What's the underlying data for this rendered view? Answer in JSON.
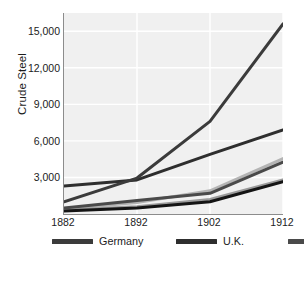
{
  "chart_data": {
    "type": "line",
    "title": "",
    "xlabel": "",
    "ylabel": "Crude Steel",
    "x": [
      1882,
      1892,
      1902,
      1912
    ],
    "xtick_labels": [
      "1882",
      "1892",
      "1902",
      "1912"
    ],
    "ytick_labels": [
      "3,000",
      "6,000",
      "9,000",
      "12,000",
      "15,000"
    ],
    "ytick_values": [
      3000,
      6000,
      9000,
      12000,
      15000
    ],
    "ylim": [
      0,
      16500
    ],
    "xlim": [
      1882,
      1912
    ],
    "grid": true,
    "legend_position": "below-axes",
    "plot_background": "#f0f0f0",
    "gridline_color": "#ffffff",
    "axis_color": "#8c8c8c",
    "series": [
      {
        "name": "Germany",
        "color": "#3b3b3b",
        "values": [
          1000,
          2950,
          7600,
          15600
        ]
      },
      {
        "name": "U.K.",
        "color": "#2e2e2e",
        "values": [
          2300,
          2800,
          4900,
          6900
        ]
      },
      {
        "name": "France",
        "color": "#4a4a4a",
        "values": [
          500,
          1100,
          1700,
          4250
        ]
      },
      {
        "name": "Austria",
        "color": "#b4b4b4",
        "values": [
          400,
          950,
          1900,
          4550
        ]
      },
      {
        "name": "Russia",
        "color": "#9a9a9a",
        "values": [
          300,
          600,
          1200,
          2800
        ]
      },
      {
        "name": "Belgium",
        "color": "#141414",
        "values": [
          250,
          500,
          1000,
          2650
        ]
      }
    ]
  },
  "legend": {
    "items": [
      {
        "label": "Germany",
        "color": "#3b3b3b"
      },
      {
        "label": "U.K.",
        "color": "#2e2e2e"
      },
      {
        "label": "France",
        "color": "#4a4a4a"
      },
      {
        "label": "Austria",
        "color": "#b4b4b4"
      },
      {
        "label": "Russia",
        "color": "#9a9a9a"
      },
      {
        "label": "Belgium",
        "color": "#141414"
      }
    ]
  }
}
